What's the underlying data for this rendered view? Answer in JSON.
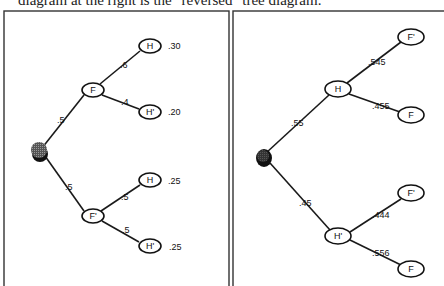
{
  "caption": "diagram at the right is the \"reversed\" tree diagram.",
  "left_tree": {
    "title": "tree diagram",
    "root": "root-node",
    "nodes": [
      {
        "id": "F",
        "label": "F",
        "x": 93,
        "y": 90
      },
      {
        "id": "Fp",
        "label": "F'",
        "x": 93,
        "y": 216
      },
      {
        "id": "H1",
        "label": "H",
        "x": 150,
        "y": 46
      },
      {
        "id": "Hp1",
        "label": "H'",
        "x": 150,
        "y": 112
      },
      {
        "id": "H2",
        "label": "H",
        "x": 150,
        "y": 180
      },
      {
        "id": "Hp2",
        "label": "H'",
        "x": 150,
        "y": 246
      }
    ],
    "branches": [
      {
        "from": "root",
        "to": "F",
        "prob": ".5"
      },
      {
        "from": "root",
        "to": "F'",
        "prob": ".5"
      },
      {
        "from": "F",
        "to": "H",
        "prob": ".6"
      },
      {
        "from": "F",
        "to": "H'",
        "prob": ".4"
      },
      {
        "from": "F'",
        "to": "H",
        "prob": ".5"
      },
      {
        "from": "F'",
        "to": "H'",
        "prob": ".5"
      }
    ],
    "joint_probs": [
      ".30",
      ".20",
      ".25",
      ".25"
    ]
  },
  "right_tree": {
    "title": "reversed tree diagram",
    "nodes": [
      {
        "id": "H",
        "label": "H",
        "x": 338,
        "y": 89
      },
      {
        "id": "Hp",
        "label": "H'",
        "x": 338,
        "y": 236
      },
      {
        "id": "Fp1",
        "label": "F'",
        "x": 411,
        "y": 37
      },
      {
        "id": "F1",
        "label": "F",
        "x": 411,
        "y": 115
      },
      {
        "id": "Fp2",
        "label": "F'",
        "x": 411,
        "y": 193
      },
      {
        "id": "F2",
        "label": "F",
        "x": 411,
        "y": 269
      }
    ],
    "branches": [
      {
        "from": "root",
        "to": "H",
        "prob": ".55"
      },
      {
        "from": "root",
        "to": "H'",
        "prob": ".45"
      },
      {
        "from": "H",
        "to": "F'",
        "prob": ".545"
      },
      {
        "from": "H",
        "to": "F",
        "prob": ".455"
      },
      {
        "from": "H'",
        "to": "F'",
        "prob": ".444"
      },
      {
        "from": "H'",
        "to": "F",
        "prob": ".556"
      }
    ]
  },
  "colors": {
    "line": "#1a1a1a",
    "root_fill": "#3a3a3a",
    "background": "#ffffff"
  }
}
